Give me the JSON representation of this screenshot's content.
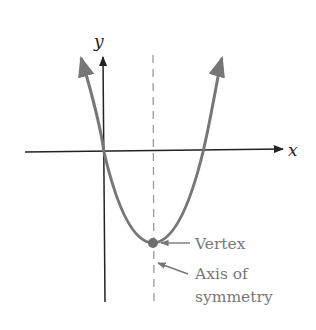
{
  "diagram": {
    "type": "parabola-annotated",
    "axes": {
      "x_label": "x",
      "y_label": "y"
    },
    "curve": {
      "description": "upward-opening parabola",
      "color": "#777777"
    },
    "axis_of_symmetry": {
      "style": "dashed",
      "color": "#999999"
    },
    "vertex": {
      "marker_color": "#6e6e6e"
    },
    "annotations": {
      "vertex_label": "Vertex",
      "axis_label_line1": "Axis of",
      "axis_label_line2": "symmetry"
    },
    "colors": {
      "axes": "#222222",
      "curve": "#777777",
      "text": "#777777"
    }
  }
}
